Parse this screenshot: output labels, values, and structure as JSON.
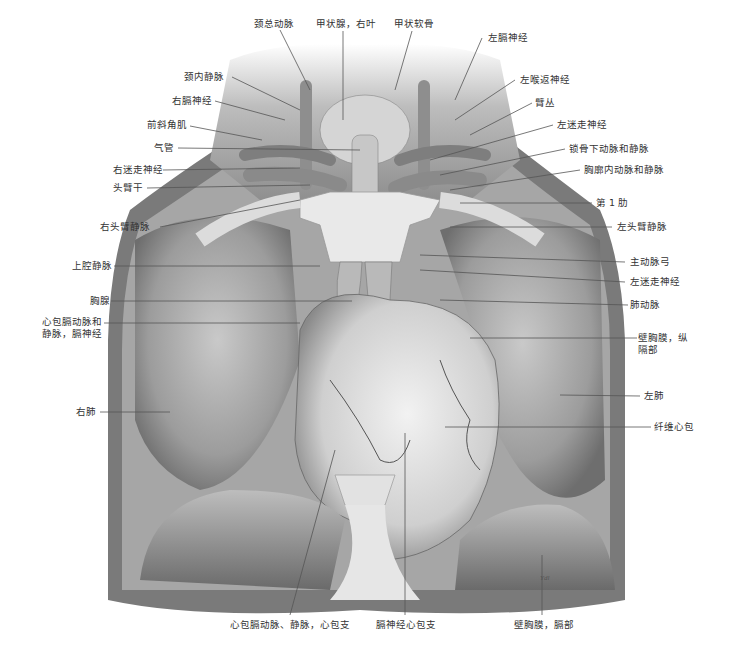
{
  "figure": {
    "type": "anatomical-illustration",
    "signature": "Ydl",
    "colors": {
      "background": "#ffffff",
      "ink": "#333333",
      "tissue_dark": "#5a5a5a",
      "tissue_mid": "#9a9a9a",
      "tissue_light": "#d8d8d8"
    }
  },
  "labels": {
    "top": [
      {
        "id": "common-carotid-artery",
        "text": "颈总动脉"
      },
      {
        "id": "thyroid-right-lobe",
        "text": "甲状腺，右叶"
      },
      {
        "id": "thyroid-cartilage",
        "text": "甲状软骨"
      }
    ],
    "left": [
      {
        "id": "internal-jugular-vein",
        "text": "颈内静脉"
      },
      {
        "id": "right-phrenic-nerve",
        "text": "右膈神经"
      },
      {
        "id": "anterior-scalene",
        "text": "前斜角肌"
      },
      {
        "id": "trachea",
        "text": "气管"
      },
      {
        "id": "right-vagus-nerve",
        "text": "右迷走神经"
      },
      {
        "id": "brachiocephalic-trunk",
        "text": "头臂干"
      },
      {
        "id": "right-brachiocephalic-vein",
        "text": "右头臂静脉"
      },
      {
        "id": "superior-vena-cava",
        "text": "上腔静脉"
      },
      {
        "id": "thymus",
        "text": "胸腺"
      },
      {
        "id": "pericardiacophrenic",
        "text": "心包膈动脉和\n静脉，膈神经"
      },
      {
        "id": "right-lung",
        "text": "右肺"
      }
    ],
    "right": [
      {
        "id": "left-phrenic-nerve",
        "text": "左膈神经"
      },
      {
        "id": "left-recurrent-laryngeal",
        "text": "左喉返神经"
      },
      {
        "id": "brachial-plexus",
        "text": "臂丛"
      },
      {
        "id": "left-vagus-nerve-upper",
        "text": "左迷走神经"
      },
      {
        "id": "subclavian-vessels",
        "text": "锁骨下动脉和静脉"
      },
      {
        "id": "internal-thoracic-vessels",
        "text": "胸廓内动脉和静脉"
      },
      {
        "id": "first-rib",
        "text": "第 1 肋"
      },
      {
        "id": "left-brachiocephalic-vein",
        "text": "左头臂静脉"
      },
      {
        "id": "aortic-arch",
        "text": "主动脉弓"
      },
      {
        "id": "left-vagus-nerve-lower",
        "text": "左迷走神经"
      },
      {
        "id": "pulmonary-artery",
        "text": "肺动脉"
      },
      {
        "id": "mediastinal-pleura",
        "text": "壁胸膜，纵\n隔部"
      },
      {
        "id": "left-lung",
        "text": "左肺"
      },
      {
        "id": "fibrous-pericardium",
        "text": "纤维心包"
      }
    ],
    "bottom": [
      {
        "id": "pericardial-branches",
        "text": "心包膈动脉、静脉，心包支"
      },
      {
        "id": "phrenic-pericardial-branch",
        "text": "膈神经心包支"
      },
      {
        "id": "diaphragmatic-pleura",
        "text": "壁胸膜，膈部"
      }
    ]
  }
}
